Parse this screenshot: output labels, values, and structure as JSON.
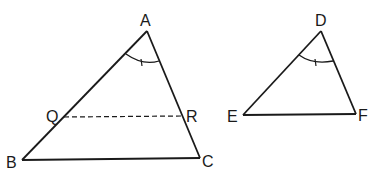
{
  "figure": {
    "triangle_abc": {
      "vertices": {
        "A": "A",
        "B": "B",
        "C": "C"
      },
      "segment_points": {
        "Q": "Q",
        "R": "R"
      },
      "angle_mark": "angle A marked with single tick"
    },
    "triangle_def": {
      "vertices": {
        "D": "D",
        "E": "E",
        "F": "F"
      },
      "angle_mark": "angle D marked with single tick"
    },
    "colors": {
      "line": "#1a1a1a",
      "background": "#ffffff"
    }
  }
}
